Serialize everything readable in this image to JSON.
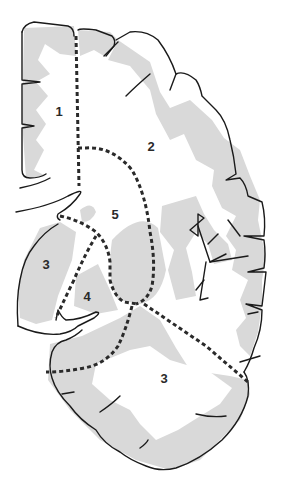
{
  "diagram": {
    "type": "brain coronal section with numbered regions",
    "colors": {
      "background": "#ffffff",
      "gray_matter": "#d9d9d9",
      "outline": "#1a1a1a",
      "boundary_dashes": "#2a2a2a",
      "label": "#2a2a2a"
    },
    "regions": [
      {
        "id": "region-1",
        "label": "1",
        "x": 59,
        "y": 111
      },
      {
        "id": "region-2",
        "label": "2",
        "x": 151,
        "y": 146
      },
      {
        "id": "region-5",
        "label": "5",
        "x": 115,
        "y": 214
      },
      {
        "id": "region-3-upper",
        "label": "3",
        "x": 46,
        "y": 264
      },
      {
        "id": "region-4",
        "label": "4",
        "x": 87,
        "y": 296
      },
      {
        "id": "region-3-lower",
        "label": "3",
        "x": 164,
        "y": 378
      }
    ]
  }
}
